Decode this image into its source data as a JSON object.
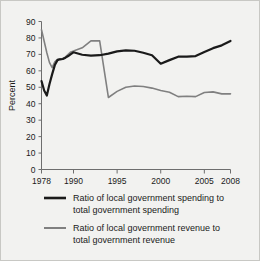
{
  "chart_data": {
    "type": "line",
    "title": "",
    "subtitle": "",
    "xlabel": "",
    "ylabel": "Percent",
    "xlim": [
      1978,
      2008
    ],
    "ylim": [
      0,
      90
    ],
    "yticks": [
      0,
      10,
      20,
      30,
      40,
      50,
      60,
      70,
      80,
      90
    ],
    "ytick_labels": [
      "0",
      "10",
      "20",
      "30",
      "40",
      "50",
      "60",
      "70",
      "80",
      "90"
    ],
    "xticks": [
      1978,
      1990,
      1995,
      2000,
      2005,
      2008
    ],
    "xtick_labels": [
      "1978",
      "1990",
      "1995",
      "2000",
      "2005",
      "2008"
    ],
    "grid": false,
    "legend_position": "below",
    "x": [
      1978,
      1979,
      1980,
      1981,
      1982,
      1983,
      1984,
      1985,
      1986,
      1987,
      1988,
      1989,
      1990,
      1991,
      1992,
      1993,
      1994,
      1995,
      1996,
      1997,
      1998,
      1999,
      2000,
      2001,
      2002,
      2003,
      2004,
      2005,
      2006,
      2007,
      2008
    ],
    "series": [
      {
        "name": "Ratio of local government spending to total government spending",
        "color": "#1a1a1a",
        "width": 2.2,
        "values": [
          53.8,
          48.0,
          45.0,
          52.0,
          58.0,
          63.5,
          66.5,
          67.0,
          67.2,
          68.0,
          69.0,
          70.2,
          71.3,
          69.8,
          69.2,
          69.5,
          70.5,
          71.8,
          72.4,
          72.2,
          71.0,
          69.5,
          64.3,
          66.5,
          68.6,
          68.6,
          69.0,
          71.5,
          73.8,
          75.5,
          78.2
        ]
      },
      {
        "name": "Ratio of local government revenue to total government revenue",
        "color": "#808080",
        "width": 1.6,
        "values": [
          85.0,
          78.0,
          71.0,
          65.0,
          62.0,
          65.5,
          67.0,
          67.3,
          67.5,
          68.5,
          70.0,
          71.5,
          72.0,
          74.0,
          78.2,
          78.2,
          43.8,
          47.5,
          50.0,
          50.8,
          50.5,
          49.5,
          48.0,
          47.0,
          44.3,
          44.5,
          44.3,
          46.8,
          47.2,
          46.0,
          46.0
        ]
      }
    ]
  },
  "legend": {
    "entries": [
      {
        "line1": "Ratio of local government spending to",
        "line2": "total government spending"
      },
      {
        "line1": "Ratio of local government revenue to",
        "line2": "total government revenue"
      }
    ]
  }
}
